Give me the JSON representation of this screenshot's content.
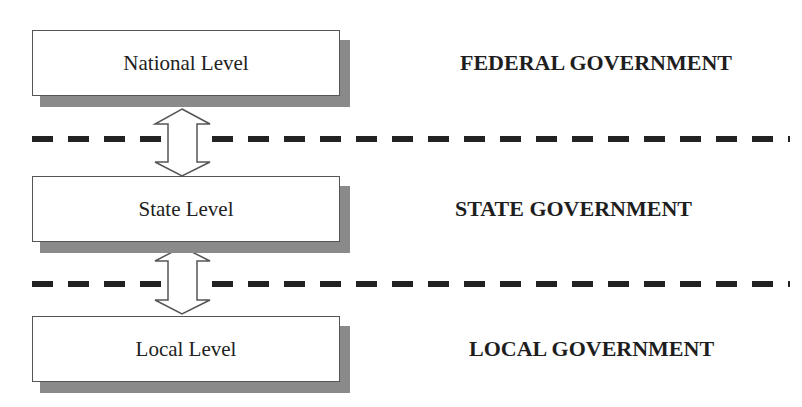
{
  "diagram": {
    "levels": [
      {
        "label": "National Level",
        "government": "FEDERAL GOVERNMENT"
      },
      {
        "label": "State Level",
        "government": "STATE GOVERNMENT"
      },
      {
        "label": "Local Level",
        "government": "LOCAL GOVERNMENT"
      }
    ],
    "connectors": [
      {
        "from": "National Level",
        "to": "State Level",
        "type": "bidirectional-arrow"
      },
      {
        "from": "State Level",
        "to": "Local Level",
        "type": "bidirectional-arrow"
      }
    ],
    "separators": [
      "dashed-line",
      "dashed-line"
    ],
    "colors": {
      "box_border": "#555555",
      "shadow": "#8a8a8a",
      "dash": "#222222",
      "text": "#1e1e1e"
    }
  }
}
